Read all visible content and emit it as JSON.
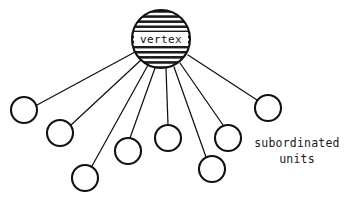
{
  "diagram": {
    "type": "star-graph",
    "background_color": "#ffffff",
    "stroke_color": "#111111",
    "vertex": {
      "label": "vertex",
      "cx": 161,
      "cy": 39,
      "r": 29,
      "fill_style": "horizontal-hatch",
      "label_plate_fill": "#ffffff"
    },
    "caption": {
      "line1": "subordinated",
      "line2": "units",
      "x": 297,
      "y1": 143,
      "y2": 159
    },
    "nodes": [
      {
        "id": "node-1",
        "cx": 24,
        "cy": 110,
        "r": 13
      },
      {
        "id": "node-2",
        "cx": 60,
        "cy": 133,
        "r": 13
      },
      {
        "id": "node-3",
        "cx": 85,
        "cy": 178,
        "r": 13
      },
      {
        "id": "node-4",
        "cx": 128,
        "cy": 151,
        "r": 13
      },
      {
        "id": "node-5",
        "cx": 168,
        "cy": 138,
        "r": 13
      },
      {
        "id": "node-6",
        "cx": 228,
        "cy": 138,
        "r": 13
      },
      {
        "id": "node-7",
        "cx": 212,
        "cy": 169,
        "r": 13
      },
      {
        "id": "node-8",
        "cx": 268,
        "cy": 108,
        "r": 13
      }
    ],
    "edges": [
      {
        "id": "edge-1",
        "from": "vertex",
        "to": "node-1",
        "x1": 135,
        "y1": 52,
        "x2": 37,
        "y2": 105
      },
      {
        "id": "edge-2",
        "from": "vertex",
        "to": "node-2",
        "x1": 141,
        "y1": 60,
        "x2": 71,
        "y2": 125
      },
      {
        "id": "edge-3",
        "from": "vertex",
        "to": "node-3",
        "x1": 148,
        "y1": 65,
        "x2": 92,
        "y2": 166
      },
      {
        "id": "edge-4",
        "from": "vertex",
        "to": "node-4",
        "x1": 155,
        "y1": 68,
        "x2": 130,
        "y2": 138
      },
      {
        "id": "edge-5",
        "from": "vertex",
        "to": "node-5",
        "x1": 166,
        "y1": 68,
        "x2": 168,
        "y2": 125
      },
      {
        "id": "edge-6",
        "from": "vertex",
        "to": "node-6",
        "x1": 180,
        "y1": 63,
        "x2": 223,
        "y2": 125
      },
      {
        "id": "edge-7",
        "from": "vertex",
        "to": "node-7",
        "x1": 174,
        "y1": 67,
        "x2": 206,
        "y2": 157
      },
      {
        "id": "edge-8",
        "from": "vertex",
        "to": "node-8",
        "x1": 188,
        "y1": 55,
        "x2": 257,
        "y2": 100
      }
    ]
  }
}
